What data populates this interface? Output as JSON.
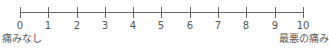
{
  "scale": {
    "type": "numeric-pain-rating-scale",
    "min": 0,
    "max": 10,
    "ticks": [
      "0",
      "1",
      "2",
      "3",
      "4",
      "5",
      "6",
      "7",
      "8",
      "9",
      "10"
    ],
    "left_anchor_label": "痛みなし",
    "right_anchor_label": "最悪の痛み",
    "line_color": "#666666",
    "text_color": "#555555"
  }
}
